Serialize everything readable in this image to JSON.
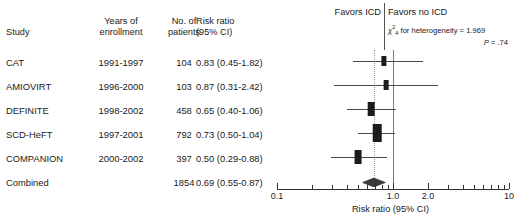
{
  "table": {
    "headers": {
      "study": "Study",
      "years_l1": "Years of",
      "years_l2": "enrollment",
      "patients_l1": "No. of",
      "patients_l2": "patients",
      "riskratio_l1": "Risk ratio",
      "riskratio_l2": "(95% CI)"
    },
    "rows": [
      {
        "study": "CAT",
        "years": "1991-1997",
        "patients": "104",
        "risk_ratio": "0.83 (0.45-1.82)"
      },
      {
        "study": "AMIOVIRT",
        "years": "1996-2000",
        "patients": "103",
        "risk_ratio": "0.87 (0.31-2.42)"
      },
      {
        "study": "DEFINITE",
        "years": "1998-2002",
        "patients": "458",
        "risk_ratio": "0.65 (0.40-1.06)"
      },
      {
        "study": "SCD-HeFT",
        "years": "1997-2001",
        "patients": "792",
        "risk_ratio": "0.73 (0.50-1.04)"
      },
      {
        "study": "COMPANION",
        "years": "2000-2002",
        "patients": "397",
        "risk_ratio": "0.50 (0.29-0.88)"
      },
      {
        "study": "Combined",
        "years": "",
        "patients": "1854",
        "risk_ratio": "0.69 (0.55-0.87)"
      }
    ]
  },
  "plot": {
    "favors_left": "Favors ICD",
    "favors_right": "Favors no ICD",
    "heterogeneity": {
      "chi_symbol": "χ",
      "superscript": "2",
      "subscript": "4",
      "text": " for heterogeneity = 1.969",
      "p_italic": "P",
      "p_value": " = .74"
    },
    "axis_title": "Risk ratio (95% CI)",
    "tick_labels": [
      "0.1",
      "1.0",
      "2.0",
      "10"
    ],
    "reference_solid": 1.0,
    "reference_dotted": 0.69
  },
  "chart_data": {
    "type": "forest",
    "title": "",
    "xlabel": "Risk ratio (95% CI)",
    "ylabel": "",
    "xscale": "log",
    "xlim": [
      0.1,
      10
    ],
    "xticks_major": [
      0.1,
      1.0,
      2.0,
      10
    ],
    "xticks_minor": [
      0.2,
      0.3,
      0.4,
      0.5,
      0.6,
      0.7,
      0.8,
      0.9,
      3,
      4,
      5,
      6,
      7,
      8,
      9
    ],
    "reference_line": 1.0,
    "pooled_line": 0.69,
    "legend": [
      "Favors ICD",
      "Favors no ICD"
    ],
    "annotations": [
      "χ²₄ for heterogeneity = 1.969",
      "P = .74"
    ],
    "points": [
      {
        "label": "CAT",
        "years": "1991-1997",
        "n": 104,
        "estimate": 0.83,
        "ci_low": 0.45,
        "ci_high": 1.82,
        "weight": 0.1
      },
      {
        "label": "AMIOVIRT",
        "years": "1996-2000",
        "n": 103,
        "estimate": 0.87,
        "ci_low": 0.31,
        "ci_high": 2.42,
        "weight": 0.06
      },
      {
        "label": "DEFINITE",
        "years": "1998-2002",
        "n": 458,
        "estimate": 0.65,
        "ci_low": 0.4,
        "ci_high": 1.06,
        "weight": 0.22
      },
      {
        "label": "SCD-HeFT",
        "years": "1997-2001",
        "n": 792,
        "estimate": 0.73,
        "ci_low": 0.5,
        "ci_high": 1.04,
        "weight": 0.38
      },
      {
        "label": "COMPANION",
        "years": "2000-2002",
        "n": 397,
        "estimate": 0.5,
        "ci_low": 0.29,
        "ci_high": 0.88,
        "weight": 0.24
      }
    ],
    "summary": {
      "label": "Combined",
      "n": 1854,
      "estimate": 0.69,
      "ci_low": 0.55,
      "ci_high": 0.87
    }
  }
}
